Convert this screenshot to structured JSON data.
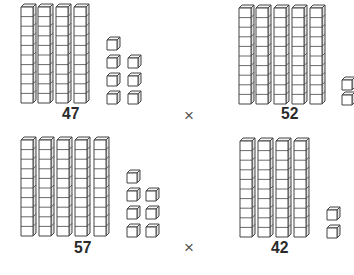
{
  "colors": {
    "stroke": "#444444",
    "fill": "#ffffff",
    "label": "#2a2a2a"
  },
  "operator_symbol": "×",
  "problems": [
    {
      "id": "47",
      "label": "47",
      "tens": 4,
      "ones": 7,
      "rods_x": [
        21,
        38,
        56,
        74
      ],
      "rods_top": 4,
      "unit_positions": [
        [
          107,
          37
        ],
        [
          107,
          55
        ],
        [
          128,
          55
        ],
        [
          107,
          73
        ],
        [
          128,
          73
        ],
        [
          107,
          91
        ],
        [
          128,
          91
        ]
      ],
      "label_pos": [
        62,
        104
      ]
    },
    {
      "id": "52",
      "label": "52",
      "tens": 5,
      "ones": 2,
      "rods_x": [
        239,
        256,
        274,
        292,
        310
      ],
      "rods_top": 5,
      "unit_positions": [
        [
          342,
          77
        ],
        [
          342,
          92
        ]
      ],
      "label_pos": [
        281,
        104
      ]
    },
    {
      "id": "57",
      "label": "57",
      "tens": 5,
      "ones": 7,
      "rods_x": [
        21,
        39,
        57,
        75,
        94
      ],
      "rods_top": 137,
      "unit_positions": [
        [
          127,
          170
        ],
        [
          127,
          188
        ],
        [
          146,
          188
        ],
        [
          127,
          206
        ],
        [
          146,
          206
        ],
        [
          127,
          224
        ],
        [
          146,
          224
        ]
      ],
      "label_pos": [
        74,
        238
      ]
    },
    {
      "id": "42",
      "label": "42",
      "tens": 4,
      "ones": 2,
      "rods_x": [
        240,
        258,
        276,
        294
      ],
      "rods_top": 138,
      "unit_positions": [
        [
          327,
          207
        ],
        [
          327,
          225
        ]
      ],
      "label_pos": [
        271,
        238
      ]
    }
  ],
  "operators": [
    {
      "symbol": "×",
      "pos": [
        184,
        107
      ]
    },
    {
      "symbol": "×",
      "pos": [
        184,
        239
      ]
    }
  ]
}
